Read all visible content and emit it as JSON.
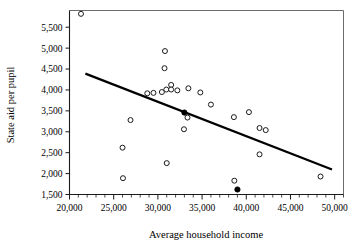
{
  "chart_data": {
    "type": "scatter",
    "title": "",
    "xlabel": "Average household income",
    "ylabel": "State aid per pupil",
    "xlim": [
      20000,
      51000
    ],
    "ylim": [
      1500,
      5900
    ],
    "grid": false,
    "legend": null,
    "x_ticks": [
      20000,
      25000,
      30000,
      35000,
      40000,
      45000,
      50000
    ],
    "x_tick_labels": [
      "20,000",
      "25,000",
      "30,000",
      "35,000",
      "40,000",
      "45,000",
      "50,000"
    ],
    "x_minor_tick_step": 1000,
    "y_ticks": [
      1500,
      2000,
      2500,
      3000,
      3500,
      4000,
      4500,
      5000,
      5500
    ],
    "y_tick_labels": [
      "1,500",
      "2,000",
      "2,500",
      "3,000",
      "3,500",
      "4,000",
      "4,500",
      "5,000",
      "5,500"
    ],
    "series": [
      {
        "name": "districts-open",
        "marker": "open-circle",
        "points": [
          {
            "x": 21300,
            "y": 5820
          },
          {
            "x": 26000,
            "y": 2620
          },
          {
            "x": 26050,
            "y": 1890
          },
          {
            "x": 26900,
            "y": 3280
          },
          {
            "x": 28800,
            "y": 3920
          },
          {
            "x": 29500,
            "y": 3930
          },
          {
            "x": 30450,
            "y": 3950
          },
          {
            "x": 30800,
            "y": 4930
          },
          {
            "x": 30750,
            "y": 4520
          },
          {
            "x": 30950,
            "y": 4010
          },
          {
            "x": 31000,
            "y": 2250
          },
          {
            "x": 31500,
            "y": 4120
          },
          {
            "x": 31500,
            "y": 4010
          },
          {
            "x": 32200,
            "y": 3990
          },
          {
            "x": 32950,
            "y": 3060
          },
          {
            "x": 33350,
            "y": 3340
          },
          {
            "x": 33450,
            "y": 4040
          },
          {
            "x": 34800,
            "y": 3940
          },
          {
            "x": 36000,
            "y": 3650
          },
          {
            "x": 38600,
            "y": 3350
          },
          {
            "x": 38650,
            "y": 1830
          },
          {
            "x": 40300,
            "y": 3470
          },
          {
            "x": 41500,
            "y": 3090
          },
          {
            "x": 41500,
            "y": 2460
          },
          {
            "x": 42200,
            "y": 3040
          },
          {
            "x": 48400,
            "y": 1930
          }
        ]
      },
      {
        "name": "districts-highlighted",
        "marker": "filled-circle",
        "points": [
          {
            "x": 33000,
            "y": 3460
          },
          {
            "x": 39000,
            "y": 1620
          }
        ]
      }
    ],
    "trendline": {
      "name": "least-squares-fit",
      "x_start": 21800,
      "y_start": 4390,
      "x_end": 49700,
      "y_end": 2100
    }
  }
}
